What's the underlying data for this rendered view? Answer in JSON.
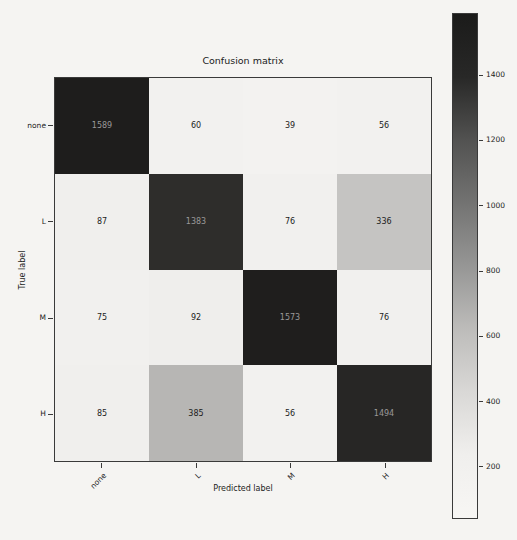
{
  "figure": {
    "background_color": "#f5f4f2",
    "axes_border_color": "#3a3a3a"
  },
  "chart_data": {
    "type": "heatmap",
    "title": "Confusion matrix",
    "xlabel": "Predicted label",
    "ylabel": "True label",
    "x_tick_labels": [
      "none",
      "L",
      "M",
      "H"
    ],
    "y_tick_labels": [
      "none",
      "L",
      "M",
      "H"
    ],
    "matrix": [
      [
        1589,
        60,
        39,
        56
      ],
      [
        87,
        1383,
        76,
        336
      ],
      [
        75,
        92,
        1573,
        76
      ],
      [
        85,
        385,
        56,
        1494
      ]
    ],
    "vmin": 39,
    "vmax": 1589,
    "colormap": "Greys",
    "cell_colors": [
      [
        "#1e1d1c",
        "#f2f1ef",
        "#f3f2f0",
        "#f2f1ef"
      ],
      [
        "#f0efed",
        "#2e2d2b",
        "#f1f0ee",
        "#c5c4c2"
      ],
      [
        "#f1f0ee",
        "#efeeec",
        "#1f1e1d",
        "#f1f0ee"
      ],
      [
        "#f0efed",
        "#b7b6b4",
        "#f2f1ef",
        "#272625"
      ]
    ],
    "dark_cell_text_color": "#9a9998",
    "light_cell_text_color": "#1c1c1c",
    "colorbar": {
      "ticks": [
        200,
        400,
        600,
        800,
        1000,
        1200,
        1400
      ],
      "gradient_stops": [
        "#1b1b1a",
        "#282827",
        "#525251",
        "#737372",
        "#969695",
        "#bdbcba",
        "#d9d8d6",
        "#f0efed",
        "#f7f6f4"
      ]
    }
  }
}
